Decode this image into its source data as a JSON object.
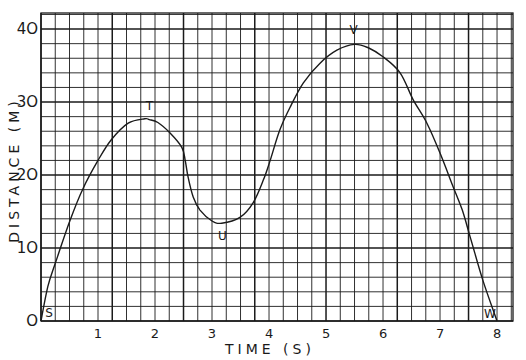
{
  "chart_data": {
    "type": "line",
    "title": "",
    "xlabel": "TIME (S)",
    "ylabel": "DISTANCE (M)",
    "xlim": [
      0,
      8.28
    ],
    "ylim": [
      0,
      42.2
    ],
    "x_ticks": [
      1,
      2,
      3,
      4,
      5,
      6,
      7,
      8
    ],
    "x_tick_labels": [
      "1",
      "2",
      "3",
      "4",
      "5",
      "6",
      "7",
      "8"
    ],
    "y_ticks": [
      0,
      10,
      20,
      30,
      40
    ],
    "y_tick_labels": [
      "O",
      "1O",
      "2O",
      "3O",
      "4O"
    ],
    "grid": true,
    "grid_minor_x_step": 0.25,
    "grid_major_x_every": 5,
    "grid_minor_y_step": 2,
    "grid_major_y_every": 5,
    "legend": null,
    "series": [
      {
        "name": "distance-time curve",
        "color": "#1a1a1a",
        "points": [
          [
            0.0,
            0.0
          ],
          [
            0.12,
            4.7
          ],
          [
            0.25,
            7.9
          ],
          [
            0.51,
            13.8
          ],
          [
            0.74,
            18.2
          ],
          [
            1.0,
            22.0
          ],
          [
            1.23,
            24.8
          ],
          [
            1.53,
            27.1
          ],
          [
            1.82,
            27.7
          ],
          [
            1.9,
            27.6
          ],
          [
            2.05,
            27.2
          ],
          [
            2.26,
            25.8
          ],
          [
            2.47,
            23.8
          ],
          [
            2.53,
            22.0
          ],
          [
            2.58,
            19.7
          ],
          [
            2.67,
            17.0
          ],
          [
            2.79,
            15.2
          ],
          [
            3.0,
            13.7
          ],
          [
            3.17,
            13.4
          ],
          [
            3.49,
            14.2
          ],
          [
            3.72,
            16.2
          ],
          [
            3.9,
            19.3
          ],
          [
            4.02,
            22.0
          ],
          [
            4.19,
            26.2
          ],
          [
            4.37,
            29.3
          ],
          [
            4.6,
            32.6
          ],
          [
            4.89,
            35.3
          ],
          [
            5.19,
            37.1
          ],
          [
            5.5,
            37.9
          ],
          [
            5.75,
            37.4
          ],
          [
            6.0,
            36.2
          ],
          [
            6.3,
            34.0
          ],
          [
            6.53,
            30.3
          ],
          [
            6.77,
            27.1
          ],
          [
            7.0,
            23.0
          ],
          [
            7.23,
            18.4
          ],
          [
            7.39,
            15.2
          ],
          [
            7.53,
            11.5
          ],
          [
            7.75,
            5.6
          ],
          [
            8.0,
            0.0
          ]
        ]
      }
    ],
    "annotations": [
      {
        "text": "S",
        "x": 0.0,
        "y": 0.0,
        "note": "start point"
      },
      {
        "text": "T",
        "x": 1.9,
        "y": 27.6,
        "note": "first local maximum"
      },
      {
        "text": "U",
        "x": 3.2,
        "y": 13.4,
        "note": "local minimum"
      },
      {
        "text": "V",
        "x": 5.5,
        "y": 37.9,
        "note": "global maximum"
      },
      {
        "text": "W",
        "x": 8.0,
        "y": 0.0,
        "note": "end point"
      }
    ]
  }
}
